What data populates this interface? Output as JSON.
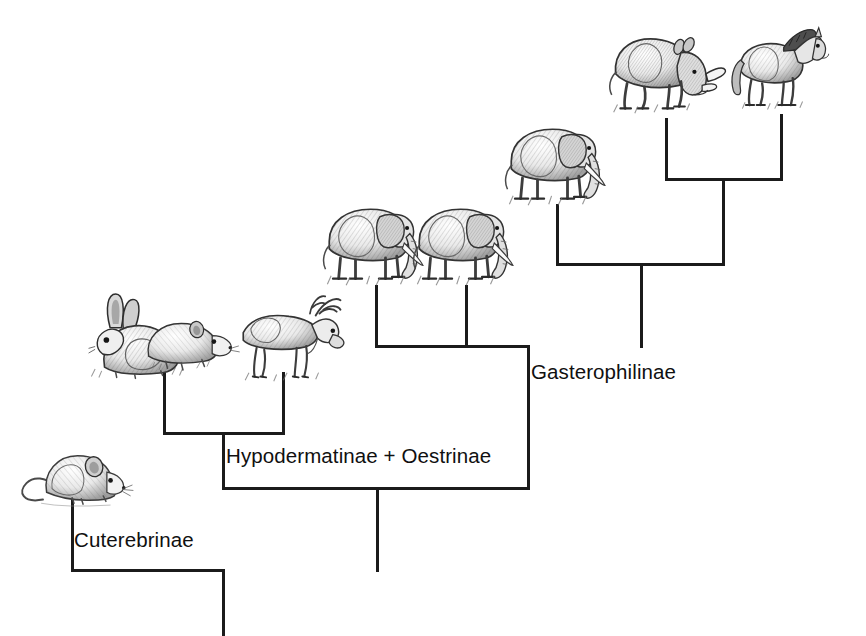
{
  "figure": {
    "type": "cladogram",
    "title": "",
    "background_color": "#ffffff",
    "line_color": "#1b1b1b"
  },
  "clade_labels": [
    {
      "id": "cuterebrinae",
      "text": "Cuterebrinae",
      "x": 74,
      "y": 530
    },
    {
      "id": "hypodermatinae",
      "text": "Hypodermatinae + Oestrinae",
      "x": 226,
      "y": 446
    },
    {
      "id": "gasterophilinae",
      "text": "Gasterophilinae",
      "x": 531,
      "y": 362
    }
  ],
  "hosts": [
    {
      "id": "mouse",
      "icon": "mouse-illustration",
      "label": "mouse",
      "tip_x": 71,
      "x": 14,
      "y": 432,
      "w": 120,
      "h": 95
    },
    {
      "id": "rabbit",
      "icon": "rabbit-illustration",
      "label": "rabbit",
      "tip_x": 163,
      "x": 82,
      "y": 284,
      "w": 120,
      "h": 100
    },
    {
      "id": "rodent",
      "icon": "rodent-illustration",
      "label": "rodent",
      "tip_x": 163,
      "x": 140,
      "y": 292,
      "w": 110,
      "h": 90
    },
    {
      "id": "deer",
      "icon": "deer-illustration",
      "label": "deer",
      "tip_x": 282,
      "x": 228,
      "y": 286,
      "w": 122,
      "h": 100
    },
    {
      "id": "elephant1",
      "icon": "elephant-illustration",
      "label": "elephant",
      "tip_x": 375,
      "x": 318,
      "y": 184,
      "w": 120,
      "h": 104
    },
    {
      "id": "elephant2",
      "icon": "elephant-illustration",
      "label": "elephant",
      "tip_x": 465,
      "x": 408,
      "y": 184,
      "w": 120,
      "h": 104
    },
    {
      "id": "elephant3",
      "icon": "elephant-illustration",
      "label": "elephant",
      "tip_x": 556,
      "x": 500,
      "y": 104,
      "w": 120,
      "h": 104
    },
    {
      "id": "rhino",
      "icon": "rhinoceros-illustration",
      "label": "rhinoceros",
      "tip_x": 665,
      "x": 605,
      "y": 18,
      "w": 125,
      "h": 100
    },
    {
      "id": "horse",
      "icon": "horse-illustration",
      "label": "horse",
      "tip_x": 780,
      "x": 728,
      "y": 14,
      "w": 115,
      "h": 100
    }
  ],
  "tree_segments": [
    {
      "id": "root-stem",
      "orient": "v",
      "x": 222,
      "y": 569,
      "len": 67
    },
    {
      "id": "root-bar",
      "orient": "h",
      "x": 71,
      "y": 569,
      "len": 154
    },
    {
      "id": "cuterebrinae-tip",
      "orient": "v",
      "x": 71,
      "y": 487,
      "len": 85
    },
    {
      "id": "node2-bar",
      "orient": "h",
      "x": 222,
      "y": 487,
      "len": 308
    },
    {
      "id": "node2-stem",
      "orient": "v",
      "x": 376,
      "y": 487,
      "len": 85
    },
    {
      "id": "hypoderm-stem",
      "orient": "v",
      "x": 222,
      "y": 432,
      "len": 58
    },
    {
      "id": "hypoderm-bar",
      "orient": "h",
      "x": 163,
      "y": 432,
      "len": 122
    },
    {
      "id": "rabbit-rodent-tip",
      "orient": "v",
      "x": 163,
      "y": 372,
      "len": 63
    },
    {
      "id": "deer-tip",
      "orient": "v",
      "x": 282,
      "y": 372,
      "len": 63
    },
    {
      "id": "gastero-stem",
      "orient": "v",
      "x": 527,
      "y": 345,
      "len": 145
    },
    {
      "id": "gastero-bar",
      "orient": "h",
      "x": 375,
      "y": 345,
      "len": 155
    },
    {
      "id": "eleph1-tip",
      "orient": "v",
      "x": 375,
      "y": 285,
      "len": 63
    },
    {
      "id": "eleph2-tip",
      "orient": "v",
      "x": 465,
      "y": 285,
      "len": 63
    },
    {
      "id": "upper-stem",
      "orient": "v",
      "x": 640,
      "y": 263,
      "len": 85
    },
    {
      "id": "upper-bar",
      "orient": "h",
      "x": 556,
      "y": 263,
      "len": 169
    },
    {
      "id": "eleph3-tip",
      "orient": "v",
      "x": 556,
      "y": 204,
      "len": 62
    },
    {
      "id": "perisso-stem",
      "orient": "v",
      "x": 722,
      "y": 178,
      "len": 88
    },
    {
      "id": "perisso-bar",
      "orient": "h",
      "x": 665,
      "y": 178,
      "len": 118
    },
    {
      "id": "rhino-tip",
      "orient": "v",
      "x": 665,
      "y": 118,
      "len": 63
    },
    {
      "id": "horse-tip",
      "orient": "v",
      "x": 780,
      "y": 114,
      "len": 67
    }
  ]
}
